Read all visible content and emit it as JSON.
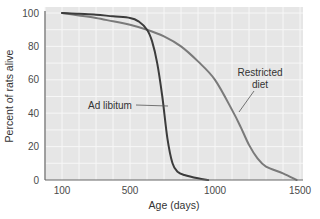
{
  "chart_data": {
    "type": "line",
    "title": "",
    "xlabel": "Age (days)",
    "ylabel": "Percent of rats alive",
    "xlim": [
      0,
      1500
    ],
    "ylim": [
      0,
      100
    ],
    "x_ticks": [
      100,
      500,
      1000,
      1500
    ],
    "y_ticks": [
      0,
      20,
      40,
      60,
      80,
      100
    ],
    "grid": true,
    "legend": "none",
    "colors": {
      "plot_bg": "#e6e6e6",
      "grid": "#f7f7f7",
      "ad_libitum": "#3c3c3c",
      "restricted": "#7a7a7a",
      "axis": "#666666"
    },
    "series": [
      {
        "name": "Ad libitum",
        "x": [
          100,
          200,
          300,
          400,
          500,
          550,
          600,
          630,
          660,
          690,
          720,
          750,
          780,
          820,
          900,
          960
        ],
        "values": [
          100,
          99.5,
          99,
          98,
          97,
          95,
          90,
          83,
          70,
          50,
          25,
          10,
          5,
          3,
          1,
          0
        ]
      },
      {
        "name": "Restricted diet",
        "x": [
          100,
          200,
          300,
          400,
          500,
          600,
          700,
          800,
          900,
          1000,
          1100,
          1150,
          1200,
          1250,
          1300,
          1400,
          1480
        ],
        "values": [
          100,
          98.5,
          97,
          95,
          93,
          90,
          86,
          80,
          71,
          60,
          42,
          32,
          21,
          13,
          8,
          4,
          0
        ]
      }
    ],
    "annotations": [
      {
        "text": "Ad libitum",
        "target_series": "Ad libitum"
      },
      {
        "text": "Restricted\ndiet",
        "target_series": "Restricted diet"
      }
    ]
  },
  "labels": {
    "xlabel": "Age (days)",
    "ylabel": "Percent of rats alive",
    "annot_adlib": "Ad libitum",
    "annot_restricted_1": "Restricted",
    "annot_restricted_2": "diet"
  }
}
